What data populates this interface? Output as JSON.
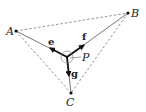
{
  "diagram": {
    "type": "geometry-vector",
    "points": {
      "A": {
        "label": "A",
        "x": 16,
        "y": 31
      },
      "B": {
        "label": "B",
        "x": 128,
        "y": 13
      },
      "C": {
        "label": "C",
        "x": 71,
        "y": 93
      },
      "P": {
        "label": "P",
        "x": 67,
        "y": 57
      }
    },
    "vectors": {
      "e": {
        "label": "e",
        "direction": "P to A"
      },
      "f": {
        "label": "f",
        "direction": "P to B"
      },
      "g": {
        "label": "g",
        "direction": "P to C"
      }
    },
    "edges": {
      "dashed": [
        "AB",
        "AC",
        "BC"
      ],
      "solid": [
        "PA",
        "PB",
        "PC"
      ]
    },
    "colors": {
      "stroke": "#222222",
      "dashed": "#777777",
      "background": "#ffffff"
    }
  }
}
